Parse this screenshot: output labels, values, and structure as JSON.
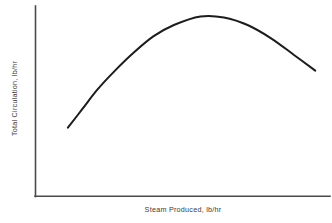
{
  "chart_data": {
    "type": "line",
    "title": "",
    "subtitle": "",
    "xlabel": "Steam Produced, lb/hr",
    "ylabel": "Total Circulation, lb/hr",
    "xlim": [
      0,
      100
    ],
    "ylim": [
      0,
      100
    ],
    "grid": false,
    "legend": null,
    "xticks": [],
    "yticks": [],
    "xticklabels": [],
    "yticklabels": [],
    "annotations": [],
    "series": [
      {
        "name": "Total Circulation vs Steam Produced",
        "color": "#1c1c1c",
        "linewidth": 2,
        "x": [
          11.0,
          16.0,
          21.0,
          27.0,
          33.0,
          40.0,
          47.0,
          56.0,
          64.0,
          72.0,
          80.0,
          88.0,
          95.0
        ],
        "y": [
          36.0,
          46.0,
          56.0,
          66.0,
          75.0,
          84.0,
          90.0,
          94.5,
          94.0,
          90.0,
          83.0,
          74.0,
          66.0
        ]
      }
    ]
  },
  "figure": {
    "background_color": "#ffffff",
    "axis_color": "#4a4a4a",
    "curve_color": "#1c1c1c",
    "label_color": "#3a3a3a"
  }
}
